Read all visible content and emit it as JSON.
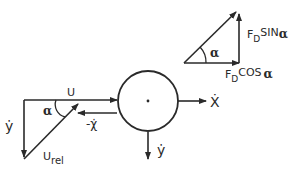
{
  "diagram": {
    "colors": {
      "stroke": "#2a2a2a",
      "background": "#ffffff"
    },
    "force_triangle": {
      "angle_label": "α",
      "vertical_label_main": "F",
      "vertical_label_sub": "D",
      "vertical_label_func": "SIN",
      "vertical_label_angle": "α",
      "horizontal_label_main": "F",
      "horizontal_label_sub": "D",
      "horizontal_label_func": "COS",
      "horizontal_label_angle": "α"
    },
    "velocity_triangle": {
      "horizontal_label": "U",
      "vertical_label": "ẏ",
      "angle_label": "α",
      "hypotenuse_label_main": "U",
      "hypotenuse_label_sub": "rel"
    },
    "body": {
      "neg_x_label": "-χ̇",
      "x_label": "Ẋ",
      "y_label": "ẏ"
    }
  }
}
